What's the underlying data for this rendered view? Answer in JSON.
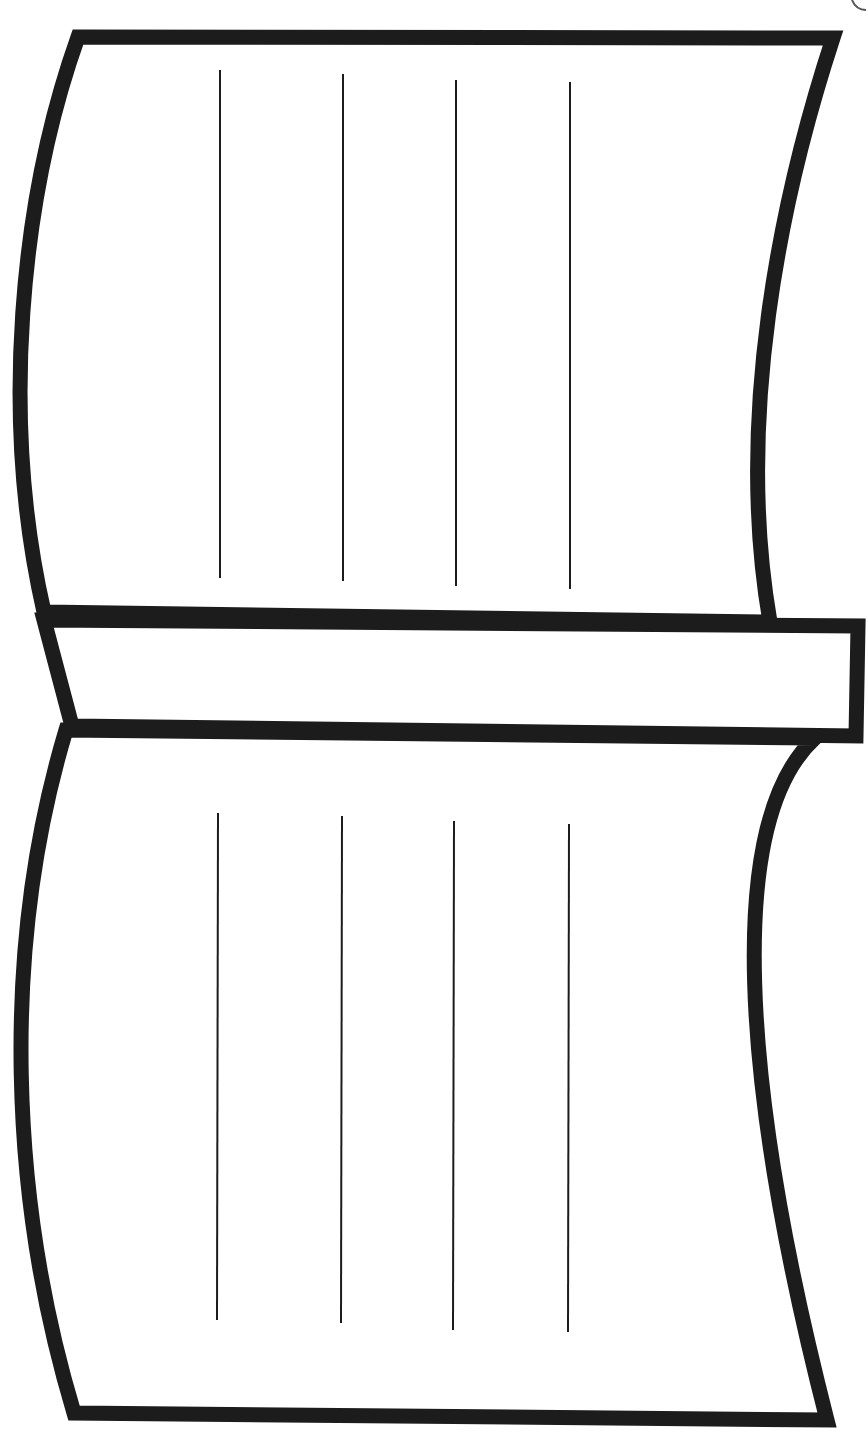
{
  "illustration": {
    "subject": "open-book-line-art",
    "stroke_color": "#1c1c1c",
    "background": "#ffffff",
    "outline_width": 15,
    "line_width": 2,
    "top_page_lines_x": [
      220,
      343,
      456,
      570
    ],
    "bottom_page_lines_x": [
      217,
      341,
      453,
      568
    ]
  }
}
